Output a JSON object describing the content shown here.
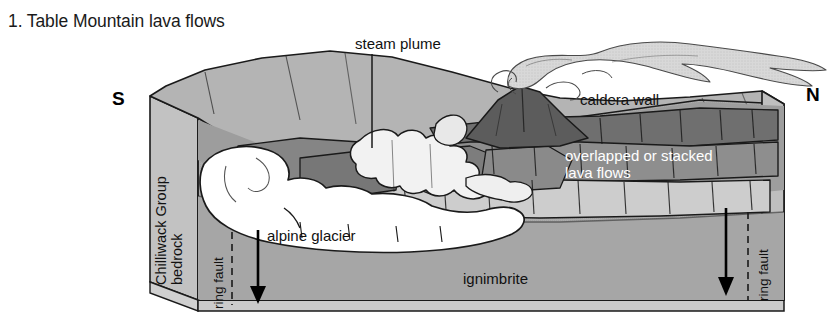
{
  "figure": {
    "title": "1. Table Mountain lava flows",
    "domain_type": "geologic-block-diagram"
  },
  "compass": {
    "left_label": "S",
    "right_label": "N"
  },
  "labels": {
    "steam_plume": "steam plume",
    "caldera_wall": "caldera wall",
    "ignimbrite": "ignimbrite",
    "alpine_glacier": "alpine glacier",
    "stacked_flows_line1": "overlapped or stacked",
    "stacked_flows_line2": "lava flows",
    "bedrock_line1": "Chilliwack Group",
    "bedrock_line2": "bedrock",
    "ring_fault_left": "ring fault",
    "ring_fault_right": "ring fault"
  },
  "colors": {
    "background": "#ffffff",
    "outline": "#1a1a1a",
    "ignimbrite_fill": "#a9a9a9",
    "bedrock_fill": "#bdbdbd",
    "upper_surface_fill": "#b6b6b6",
    "lava_flow_mid": "#9a9a9a",
    "lava_flow_dark": "#6f6f6f",
    "lava_flow_light": "#cfcfcf",
    "cone_fill": "#5d5d5d",
    "glacier_fill": "#ffffff",
    "plume_fill": "#d6d6d6",
    "white_text": "#ffffff",
    "black_text": "#111111"
  },
  "annotations": {
    "leader_lines": [
      {
        "name": "steam-plume-leader",
        "from_label": "steam plume",
        "direction": "down"
      },
      {
        "name": "alpine-glacier-leader",
        "from_label": "alpine glacier",
        "direction": "up"
      }
    ],
    "fault_arrows": [
      {
        "name": "ring-fault-arrow-left",
        "direction": "down",
        "style": "dashed-line-with-arrow"
      },
      {
        "name": "ring-fault-arrow-right",
        "direction": "down",
        "style": "dashed-line-with-arrow"
      }
    ]
  }
}
